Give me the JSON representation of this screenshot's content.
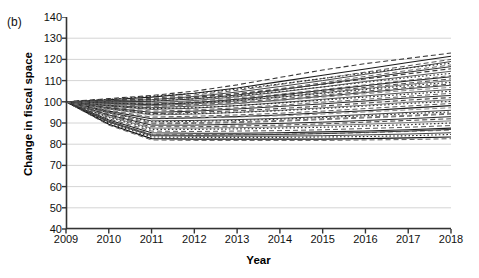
{
  "figure": {
    "panel_label": "(b)",
    "xlabel": "Year",
    "ylabel": "Change in fiscal space"
  },
  "chart_data": {
    "type": "line",
    "title": "",
    "subtitle": "",
    "panel": "(b)",
    "xlabel": "Year",
    "ylabel": "Change in fiscal space",
    "x": [
      2009,
      2010,
      2011,
      2012,
      2013,
      2014,
      2015,
      2016,
      2017,
      2018
    ],
    "xlim": [
      2009,
      2018
    ],
    "ylim": [
      40,
      140
    ],
    "ytick_labels": [
      "40",
      "50",
      "60",
      "70",
      "80",
      "90",
      "100",
      "110",
      "120",
      "130",
      "140"
    ],
    "ytick_values": [
      40,
      50,
      60,
      70,
      80,
      90,
      100,
      110,
      120,
      130,
      140
    ],
    "xtick_labels": [
      "2009",
      "2010",
      "2011",
      "2012",
      "2013",
      "2014",
      "2015",
      "2016",
      "2017",
      "2018"
    ],
    "grid": "horizontal",
    "legend": "none",
    "baseline_value": 100,
    "note": "Spaghetti plot: ~44 country trajectories indexed to 100 in 2009, drawn in grayscale with mixed solid/dashed/dotted styles.",
    "series": [
      {
        "name": "s01",
        "style": "dashed",
        "color": "#3a3a3a",
        "width": 1.1,
        "values": [
          100,
          101.5,
          103.0,
          105.0,
          108.0,
          111.5,
          115.0,
          118.0,
          120.5,
          123.0
        ]
      },
      {
        "name": "s02",
        "style": "solid",
        "color": "#1c1c1c",
        "width": 1.1,
        "values": [
          100,
          101.0,
          102.2,
          104.0,
          106.5,
          109.5,
          112.5,
          115.5,
          118.5,
          121.5
        ]
      },
      {
        "name": "s03",
        "style": "dashed",
        "color": "#555555",
        "width": 1.0,
        "values": [
          100,
          100.8,
          101.6,
          103.2,
          105.4,
          108.2,
          111.0,
          114.0,
          117.0,
          120.0
        ]
      },
      {
        "name": "s04",
        "style": "solid",
        "color": "#444444",
        "width": 1.0,
        "values": [
          100,
          100.5,
          101.0,
          102.5,
          104.6,
          107.2,
          110.0,
          113.0,
          116.0,
          119.0
        ]
      },
      {
        "name": "s05",
        "style": "dotted",
        "color": "#2b2b2b",
        "width": 1.1,
        "values": [
          100,
          101.2,
          102.6,
          104.0,
          106.0,
          108.4,
          111.0,
          113.6,
          116.0,
          118.2
        ]
      },
      {
        "name": "s06",
        "style": "dashed",
        "color": "#6a6a6a",
        "width": 1.0,
        "values": [
          100,
          100.3,
          100.8,
          102.0,
          103.8,
          106.2,
          109.0,
          112.0,
          114.8,
          117.4
        ]
      },
      {
        "name": "s07",
        "style": "solid",
        "color": "#2f2f2f",
        "width": 1.0,
        "values": [
          100,
          100.0,
          100.2,
          101.4,
          103.2,
          105.6,
          108.4,
          111.2,
          114.0,
          116.6
        ]
      },
      {
        "name": "s08",
        "style": "dashed",
        "color": "#3f3f3f",
        "width": 1.2,
        "values": [
          100,
          100.6,
          101.2,
          102.2,
          103.8,
          105.8,
          108.2,
          110.8,
          113.2,
          115.6
        ]
      },
      {
        "name": "s09",
        "style": "solid",
        "color": "#565656",
        "width": 1.0,
        "values": [
          100,
          99.6,
          99.4,
          100.6,
          102.4,
          104.6,
          107.0,
          109.6,
          112.0,
          114.4
        ]
      },
      {
        "name": "s10",
        "style": "dotted",
        "color": "#3c3c3c",
        "width": 1.1,
        "values": [
          100,
          100.2,
          100.4,
          101.4,
          102.8,
          104.8,
          107.0,
          109.2,
          111.4,
          113.4
        ]
      },
      {
        "name": "s11",
        "style": "dashed",
        "color": "#777777",
        "width": 1.0,
        "values": [
          100,
          99.8,
          99.6,
          100.4,
          101.8,
          103.6,
          105.8,
          108.0,
          110.2,
          112.4
        ]
      },
      {
        "name": "s12",
        "style": "solid",
        "color": "#1f1f1f",
        "width": 1.0,
        "values": [
          100,
          99.2,
          98.6,
          99.6,
          101.2,
          103.2,
          105.4,
          107.6,
          109.8,
          111.8
        ]
      },
      {
        "name": "s13",
        "style": "dashed",
        "color": "#4a4a4a",
        "width": 1.0,
        "values": [
          100,
          99.5,
          99.0,
          99.8,
          101.0,
          102.8,
          104.8,
          106.8,
          108.8,
          110.8
        ]
      },
      {
        "name": "s14",
        "style": "solid",
        "color": "#6d6d6d",
        "width": 1.0,
        "values": [
          100,
          99.0,
          98.2,
          99.0,
          100.4,
          102.2,
          104.2,
          106.2,
          108.2,
          110.0
        ]
      },
      {
        "name": "s15",
        "style": "dotted",
        "color": "#303030",
        "width": 1.1,
        "values": [
          100,
          99.4,
          98.8,
          99.4,
          100.6,
          102.2,
          104.0,
          105.8,
          107.6,
          109.2
        ]
      },
      {
        "name": "s16",
        "style": "dashed",
        "color": "#5c5c5c",
        "width": 1.1,
        "values": [
          100,
          98.8,
          97.8,
          98.6,
          99.8,
          101.4,
          103.2,
          105.0,
          106.8,
          108.4
        ]
      },
      {
        "name": "s17",
        "style": "solid",
        "color": "#3b3b3b",
        "width": 1.0,
        "values": [
          100,
          98.4,
          97.2,
          98.0,
          99.2,
          100.8,
          102.6,
          104.4,
          106.2,
          107.8
        ]
      },
      {
        "name": "s18",
        "style": "dashed",
        "color": "#828282",
        "width": 1.0,
        "values": [
          100,
          98.6,
          97.6,
          98.2,
          99.2,
          100.6,
          102.2,
          103.8,
          105.4,
          106.8
        ]
      },
      {
        "name": "s19",
        "style": "solid",
        "color": "#4f4f4f",
        "width": 1.0,
        "values": [
          100,
          98.0,
          96.4,
          97.0,
          98.2,
          99.6,
          101.2,
          102.8,
          104.4,
          105.8
        ]
      },
      {
        "name": "s20",
        "style": "dotted",
        "color": "#272727",
        "width": 1.1,
        "values": [
          100,
          98.2,
          96.8,
          97.2,
          98.2,
          99.4,
          100.8,
          102.2,
          103.6,
          105.0
        ]
      },
      {
        "name": "s21",
        "style": "dashed",
        "color": "#666666",
        "width": 1.0,
        "values": [
          100,
          97.6,
          95.6,
          96.2,
          97.2,
          98.4,
          99.8,
          101.2,
          102.6,
          104.0
        ]
      },
      {
        "name": "s22",
        "style": "solid",
        "color": "#2a2a2a",
        "width": 1.0,
        "values": [
          100,
          97.2,
          95.0,
          95.6,
          96.6,
          97.8,
          99.0,
          100.4,
          101.8,
          103.0
        ]
      },
      {
        "name": "s23",
        "style": "dashed",
        "color": "#474747",
        "width": 1.1,
        "values": [
          100,
          97.0,
          94.4,
          95.0,
          95.8,
          96.8,
          98.0,
          99.4,
          100.8,
          102.0
        ]
      },
      {
        "name": "s24",
        "style": "solid",
        "color": "#707070",
        "width": 1.0,
        "values": [
          100,
          96.6,
          93.8,
          94.2,
          95.0,
          96.0,
          97.2,
          98.4,
          99.8,
          101.0
        ]
      },
      {
        "name": "s25",
        "style": "dotted",
        "color": "#353535",
        "width": 1.1,
        "values": [
          100,
          96.8,
          94.2,
          94.4,
          95.0,
          95.8,
          96.8,
          98.0,
          99.2,
          100.2
        ]
      },
      {
        "name": "s26",
        "style": "dashed",
        "color": "#595959",
        "width": 1.0,
        "values": [
          100,
          96.0,
          92.8,
          93.2,
          93.8,
          94.6,
          95.6,
          96.8,
          98.0,
          99.2
        ]
      },
      {
        "name": "s27",
        "style": "solid",
        "color": "#1a1a1a",
        "width": 1.1,
        "values": [
          100,
          95.6,
          92.0,
          92.4,
          93.0,
          93.8,
          94.8,
          95.8,
          97.0,
          98.2
        ]
      },
      {
        "name": "s28",
        "style": "dashed",
        "color": "#8a8a8a",
        "width": 1.0,
        "values": [
          100,
          95.8,
          92.4,
          92.4,
          92.8,
          93.4,
          94.2,
          95.2,
          96.2,
          97.2
        ]
      },
      {
        "name": "s29",
        "style": "solid",
        "color": "#3d3d3d",
        "width": 1.0,
        "values": [
          100,
          95.0,
          91.0,
          91.2,
          91.6,
          92.2,
          93.0,
          94.0,
          95.0,
          96.0
        ]
      },
      {
        "name": "s30",
        "style": "dotted",
        "color": "#2e2e2e",
        "width": 1.1,
        "values": [
          100,
          94.8,
          90.6,
          90.8,
          91.2,
          91.8,
          92.6,
          93.4,
          94.4,
          95.2
        ]
      },
      {
        "name": "s31",
        "style": "dashed",
        "color": "#636363",
        "width": 1.0,
        "values": [
          100,
          94.2,
          89.6,
          89.8,
          90.2,
          90.8,
          91.6,
          92.4,
          93.2,
          94.2
        ]
      },
      {
        "name": "s32",
        "style": "solid",
        "color": "#252525",
        "width": 1.0,
        "values": [
          100,
          93.8,
          89.0,
          89.0,
          89.4,
          89.8,
          90.4,
          91.2,
          92.0,
          93.0
        ]
      },
      {
        "name": "s33",
        "style": "dashed",
        "color": "#4c4c4c",
        "width": 1.1,
        "values": [
          100,
          93.4,
          88.2,
          88.2,
          88.6,
          89.0,
          89.6,
          90.4,
          91.2,
          92.0
        ]
      },
      {
        "name": "s34",
        "style": "solid",
        "color": "#757575",
        "width": 1.0,
        "values": [
          100,
          93.0,
          87.6,
          87.6,
          87.8,
          88.2,
          88.8,
          89.4,
          90.2,
          91.0
        ]
      },
      {
        "name": "s35",
        "style": "dotted",
        "color": "#333333",
        "width": 1.2,
        "values": [
          100,
          92.6,
          87.0,
          87.0,
          87.2,
          87.6,
          88.0,
          88.6,
          89.2,
          90.0
        ]
      },
      {
        "name": "s36",
        "style": "dashed",
        "color": "#585858",
        "width": 1.0,
        "values": [
          100,
          92.0,
          86.2,
          86.0,
          86.2,
          86.4,
          86.8,
          87.4,
          88.0,
          88.8
        ]
      },
      {
        "name": "s37",
        "style": "solid",
        "color": "#1e1e1e",
        "width": 1.1,
        "values": [
          100,
          91.4,
          85.4,
          85.2,
          85.2,
          85.4,
          85.8,
          86.2,
          86.8,
          87.6
        ]
      },
      {
        "name": "s38",
        "style": "dashed",
        "color": "#7e7e7e",
        "width": 1.0,
        "values": [
          100,
          91.0,
          84.8,
          84.6,
          84.6,
          84.8,
          85.0,
          85.4,
          86.0,
          86.6
        ]
      },
      {
        "name": "s39",
        "style": "solid",
        "color": "#404040",
        "width": 1.0,
        "values": [
          100,
          90.4,
          84.0,
          83.8,
          83.8,
          83.8,
          84.0,
          84.4,
          84.8,
          85.4
        ]
      },
      {
        "name": "s40",
        "style": "dotted",
        "color": "#2c2c2c",
        "width": 1.1,
        "values": [
          100,
          90.0,
          83.4,
          83.2,
          83.2,
          83.2,
          83.4,
          83.6,
          84.0,
          84.6
        ]
      },
      {
        "name": "s41",
        "style": "solid",
        "color": "#0f0f0f",
        "width": 1.2,
        "values": [
          100,
          89.4,
          82.6,
          82.4,
          82.4,
          82.4,
          82.4,
          82.6,
          83.0,
          83.4
        ]
      },
      {
        "name": "s42",
        "style": "dashed",
        "color": "#5e5e5e",
        "width": 1.0,
        "values": [
          100,
          89.0,
          82.0,
          81.8,
          81.8,
          81.8,
          81.8,
          82.0,
          82.2,
          82.6
        ]
      },
      {
        "name": "s43",
        "style": "solid",
        "color": "#383838",
        "width": 1.0,
        "values": [
          100,
          90.8,
          84.4,
          84.2,
          84.4,
          84.6,
          85.0,
          85.6,
          86.2,
          87.0
        ]
      },
      {
        "name": "s44",
        "style": "dashed",
        "color": "#6f6f6f",
        "width": 1.0,
        "values": [
          100,
          94.6,
          90.0,
          90.2,
          90.6,
          91.2,
          92.0,
          92.8,
          93.6,
          94.6
        ]
      }
    ]
  }
}
